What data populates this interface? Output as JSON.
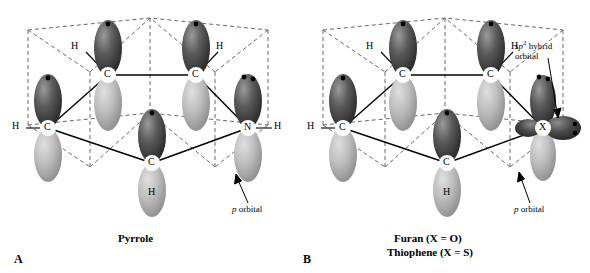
{
  "figure": {
    "panels": [
      {
        "letter": "A",
        "caption": "Pyrrole",
        "atom_labels": [
          "C",
          "C",
          "C",
          "C",
          "N"
        ],
        "hydrogen_labels": [
          "H",
          "H",
          "H",
          "H",
          "H"
        ],
        "annotations": [
          {
            "text_plain": "p orbital",
            "italic_part": "p",
            "rest": " orbital"
          }
        ]
      },
      {
        "letter": "B",
        "caption_line1": "Furan (X = O)",
        "caption_line2": "Thiophene (X = S)",
        "atom_labels": [
          "C",
          "C",
          "C",
          "C",
          "X"
        ],
        "hydrogen_labels": [
          "H",
          "H",
          "H",
          "H"
        ],
        "annotations": [
          {
            "line1_italic": "sp",
            "line1_sup": "2",
            "line1_rest": " hybrid",
            "line2": "orbital"
          },
          {
            "text_plain": "p orbital",
            "italic_part": "p",
            "rest": " orbital"
          }
        ]
      }
    ],
    "colors": {
      "lobe_dark": "#3d3d3d",
      "lobe_light": "#b8b8b8",
      "ring_line": "#000000",
      "dashed_line": "#555555",
      "text": "#000000",
      "background": "#ffffff"
    }
  }
}
